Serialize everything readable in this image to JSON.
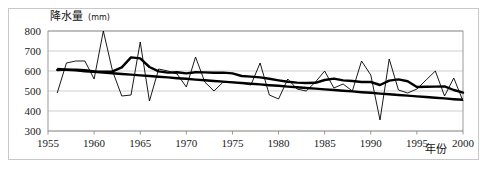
{
  "chart_data": {
    "type": "line",
    "ylabel": "降水量(mm)",
    "ylabel_unit": "mm",
    "ylabel_main": "降水量",
    "xlabel": "年份",
    "xlim": [
      1955,
      2000
    ],
    "ylim": [
      300,
      800
    ],
    "yticks": [
      300,
      400,
      500,
      600,
      700,
      800
    ],
    "xticks": [
      1955,
      1960,
      1965,
      1970,
      1975,
      1980,
      1985,
      1990,
      1995,
      2000
    ],
    "grid": true,
    "legend": "none",
    "line_color": "#000000",
    "grid_color": "#b9b9b9",
    "x": [
      1956,
      1957,
      1958,
      1959,
      1960,
      1961,
      1962,
      1963,
      1964,
      1965,
      1966,
      1967,
      1968,
      1969,
      1970,
      1971,
      1972,
      1973,
      1974,
      1975,
      1976,
      1977,
      1978,
      1979,
      1980,
      1981,
      1982,
      1983,
      1984,
      1985,
      1986,
      1987,
      1988,
      1989,
      1990,
      1991,
      1992,
      1993,
      1994,
      1995,
      1996,
      1997,
      1998,
      1999,
      2000
    ],
    "series": [
      {
        "name": "年降水量",
        "style": "thin",
        "values": [
          490,
          640,
          650,
          650,
          560,
          800,
          600,
          475,
          480,
          745,
          450,
          610,
          600,
          585,
          520,
          670,
          545,
          500,
          545,
          545,
          540,
          530,
          640,
          480,
          460,
          560,
          510,
          500,
          545,
          600,
          515,
          535,
          500,
          650,
          580,
          355,
          660,
          505,
          490,
          510,
          555,
          600,
          475,
          565,
          450
        ]
      },
      {
        "name": "5年滑动平均",
        "style": "thick",
        "values": [
          605,
          607,
          607,
          604,
          598,
          597,
          598,
          618,
          668,
          663,
          620,
          598,
          592,
          594,
          588,
          594,
          593,
          591,
          592,
          588,
          575,
          572,
          568,
          561,
          553,
          546,
          542,
          540,
          541,
          555,
          562,
          553,
          550,
          545,
          545,
          530,
          552,
          558,
          549,
          520,
          521,
          522,
          523,
          505,
          492
        ]
      },
      {
        "name": "线性趋势",
        "style": "trend",
        "values": [
          610,
          606,
          603,
          599,
          596,
          592,
          589,
          585,
          582,
          578,
          575,
          571,
          568,
          564,
          561,
          557,
          554,
          550,
          547,
          543,
          540,
          536,
          533,
          529,
          526,
          522,
          519,
          515,
          512,
          508,
          505,
          501,
          498,
          494,
          491,
          487,
          484,
          480,
          477,
          473,
          470,
          466,
          463,
          459,
          456
        ]
      }
    ]
  }
}
